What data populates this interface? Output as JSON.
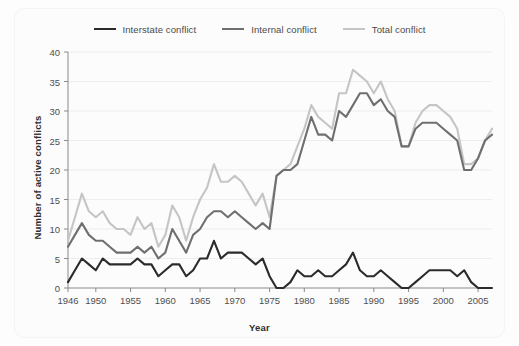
{
  "chart_data": {
    "type": "line",
    "title": "",
    "xlabel": "Year",
    "ylabel": "Number of active conflicts",
    "xlim": [
      1946,
      2007
    ],
    "ylim": [
      0,
      40
    ],
    "yticks": [
      0,
      5,
      10,
      15,
      20,
      25,
      30,
      35,
      40
    ],
    "xticks": [
      1946,
      1950,
      1955,
      1960,
      1965,
      1970,
      1975,
      1980,
      1985,
      1990,
      1995,
      2000,
      2005
    ],
    "grid": true,
    "legend_position": "top-center",
    "x": [
      1946,
      1947,
      1948,
      1949,
      1950,
      1951,
      1952,
      1953,
      1954,
      1955,
      1956,
      1957,
      1958,
      1959,
      1960,
      1961,
      1962,
      1963,
      1964,
      1965,
      1966,
      1967,
      1968,
      1969,
      1970,
      1971,
      1972,
      1973,
      1974,
      1975,
      1976,
      1977,
      1978,
      1979,
      1980,
      1981,
      1982,
      1983,
      1984,
      1985,
      1986,
      1987,
      1988,
      1989,
      1990,
      1991,
      1992,
      1993,
      1994,
      1995,
      1996,
      1997,
      1998,
      1999,
      2000,
      2001,
      2002,
      2003,
      2004,
      2005,
      2006,
      2007
    ],
    "series": [
      {
        "name": "Interstate conflict",
        "color": "#2b2b2b",
        "width": 2.1,
        "values": [
          1,
          3,
          5,
          4,
          3,
          5,
          4,
          4,
          4,
          4,
          5,
          4,
          4,
          2,
          3,
          4,
          4,
          2,
          3,
          5,
          5,
          8,
          5,
          6,
          6,
          6,
          5,
          4,
          5,
          2,
          0,
          0,
          1,
          3,
          2,
          2,
          3,
          2,
          2,
          3,
          4,
          6,
          3,
          2,
          2,
          3,
          2,
          1,
          0,
          0,
          1,
          2,
          3,
          3,
          3,
          3,
          2,
          3,
          1,
          0,
          0,
          0
        ]
      },
      {
        "name": "Internal conflict",
        "color": "#6f6f6f",
        "width": 2.1,
        "values": [
          7,
          9,
          11,
          9,
          8,
          8,
          7,
          6,
          6,
          6,
          7,
          6,
          7,
          5,
          6,
          10,
          8,
          6,
          9,
          10,
          12,
          13,
          13,
          12,
          13,
          12,
          11,
          10,
          11,
          10,
          19,
          20,
          20,
          21,
          25,
          29,
          26,
          26,
          25,
          30,
          29,
          31,
          33,
          33,
          31,
          32,
          30,
          29,
          24,
          24,
          27,
          28,
          28,
          28,
          27,
          26,
          25,
          20,
          20,
          22,
          25,
          26
        ]
      },
      {
        "name": "Total conflict",
        "color": "#c5c5c5",
        "width": 2.1,
        "values": [
          8,
          12,
          16,
          13,
          12,
          13,
          11,
          10,
          10,
          9,
          12,
          10,
          11,
          7,
          9,
          14,
          12,
          8,
          12,
          15,
          17,
          21,
          18,
          18,
          19,
          18,
          16,
          14,
          16,
          12,
          19,
          20,
          21,
          24,
          27,
          31,
          29,
          28,
          27,
          33,
          33,
          37,
          36,
          35,
          33,
          35,
          32,
          30,
          24,
          24,
          28,
          30,
          31,
          31,
          30,
          29,
          27,
          21,
          21,
          22,
          25,
          27
        ]
      }
    ]
  },
  "legend": {
    "items": [
      {
        "label": "Interstate conflict",
        "color": "#2b2b2b"
      },
      {
        "label": "Internal conflict",
        "color": "#6f6f6f"
      },
      {
        "label": "Total conflict",
        "color": "#c5c5c5"
      }
    ]
  },
  "axes": {
    "x_title": "Year",
    "y_title": "Number of active conflicts"
  }
}
